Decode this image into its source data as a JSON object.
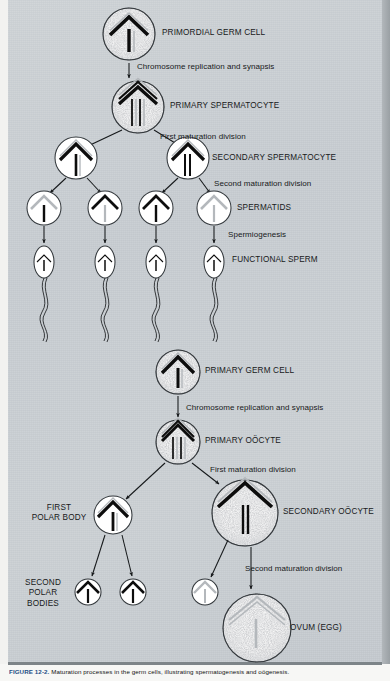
{
  "figure": {
    "caption_label": "FIGURE 12-2.",
    "caption_text": "Maturation processes in the germ cells, illustrating spermatogenesis and oögenesis."
  },
  "colors": {
    "panel_background": "#c9ced2",
    "chromosome_dark": "#0d0d0d",
    "chromosome_light": "#b9bdc1",
    "cell_fill": "#ffffff",
    "outline": "#2b2f33",
    "caption_accent": "#1d4f86"
  },
  "spermatogenesis": {
    "cells": [
      {
        "id": "primordial-germ-cell",
        "label": "PRIMORDIAL GERM CELL",
        "cx": 129,
        "cy": 34,
        "r": 26,
        "style": "stipple",
        "chromosomes": "chevron-dark-bar-dark"
      },
      {
        "id": "primary-spermatocyte",
        "label": "PRIMARY SPERMATOCYTE",
        "cx": 138,
        "cy": 107,
        "r": 26,
        "style": "stipple",
        "chromosomes": "tetrad"
      },
      {
        "id": "secondary-spermatocyte-left",
        "label": "",
        "cx": 76,
        "cy": 158,
        "r": 21,
        "style": "plain",
        "chromosomes": "chevron-dark-bar-dark"
      },
      {
        "id": "secondary-spermatocyte-right",
        "label": "SECONDARY SPERMATOCYTE",
        "cx": 188,
        "cy": 158,
        "r": 21,
        "style": "plain",
        "chromosomes": "dyad"
      }
    ],
    "spermatids": {
      "label": "SPERMATIDS",
      "items": [
        {
          "id": "spermatid-1",
          "cx": 44,
          "cy": 208,
          "chevron": "light",
          "bar": "dark"
        },
        {
          "id": "spermatid-2",
          "cx": 105,
          "cy": 208,
          "chevron": "dark",
          "bar": "light"
        },
        {
          "id": "spermatid-3",
          "cx": 156,
          "cy": 208,
          "chevron": "dark",
          "bar": "dark"
        },
        {
          "id": "spermatid-4",
          "cx": 214,
          "cy": 208,
          "chevron": "light",
          "bar": "light"
        }
      ]
    },
    "sperm": {
      "label": "FUNCTIONAL SPERM",
      "items": [
        {
          "id": "sperm-1",
          "cx": 44,
          "cy": 262
        },
        {
          "id": "sperm-2",
          "cx": 105,
          "cy": 262
        },
        {
          "id": "sperm-3",
          "cx": 156,
          "cy": 262
        },
        {
          "id": "sperm-4",
          "cx": 214,
          "cy": 262
        }
      ]
    },
    "steps": [
      {
        "id": "step-chromosome-replication-male",
        "label": "Chromosome replication and synapsis"
      },
      {
        "id": "step-first-maturation-division-male",
        "label": "First maturation division"
      },
      {
        "id": "step-second-maturation-division-male",
        "label": "Second maturation division"
      },
      {
        "id": "step-spermiogenesis",
        "label": "Spermiogenesis"
      }
    ]
  },
  "oogenesis": {
    "cells": [
      {
        "id": "primary-germ-cell",
        "label": "PRIMARY GERM CELL",
        "cx": 178,
        "cy": 372,
        "r": 22,
        "style": "stipple",
        "chromosomes": "chevron-dark-bar-dark"
      },
      {
        "id": "primary-oocyte",
        "label": "PRIMARY OÖCYTE",
        "cx": 178,
        "cy": 442,
        "r": 22,
        "style": "stipple",
        "chromosomes": "tetrad"
      },
      {
        "id": "first-polar-body",
        "label": "FIRST\nPOLAR BODY",
        "cx": 113,
        "cy": 515,
        "r": 19,
        "style": "plain",
        "chromosomes": "chevron-dark-bar-dark"
      },
      {
        "id": "secondary-oocyte",
        "label": "SECONDARY OÖCYTE",
        "cx": 245,
        "cy": 513,
        "r": 33,
        "style": "stipple",
        "chromosomes": "chevron-dark-bar-dark"
      },
      {
        "id": "ovum",
        "label": "OVUM (EGG)",
        "cx": 257,
        "cy": 628,
        "r": 34,
        "style": "stipple",
        "chromosomes": "light"
      }
    ],
    "second_polar_bodies": {
      "label": "SECOND\nPOLAR\nBODIES",
      "items": [
        {
          "id": "second-polar-body-1",
          "cx": 88,
          "cy": 592,
          "r": 13
        },
        {
          "id": "second-polar-body-2",
          "cx": 133,
          "cy": 592,
          "r": 13
        },
        {
          "id": "second-polar-body-3",
          "cx": 205,
          "cy": 592,
          "r": 13
        }
      ]
    },
    "steps": [
      {
        "id": "step-chromosome-replication-female",
        "label": "Chromosome replication and synapsis"
      },
      {
        "id": "step-first-maturation-division-female",
        "label": "First maturation division"
      },
      {
        "id": "step-second-maturation-division-female",
        "label": "Second maturation division"
      }
    ]
  }
}
